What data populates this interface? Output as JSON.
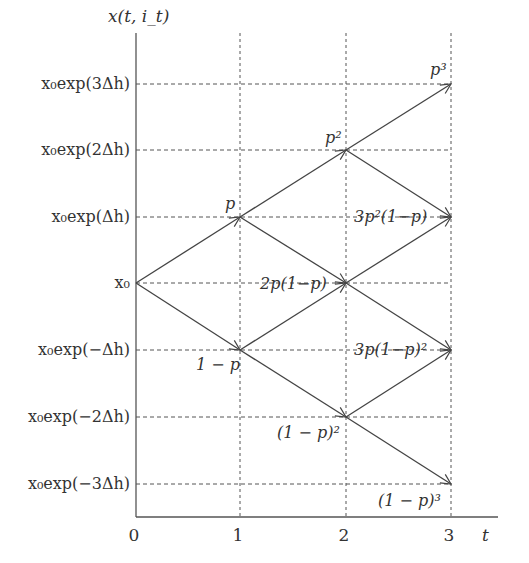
{
  "diagram": {
    "type": "binomial-tree",
    "y_axis_label": "x(t, i_t)",
    "x_axis_label": "t",
    "x_ticks": [
      "0",
      "1",
      "2",
      "3"
    ],
    "y_levels": [
      "x₀exp(3Δh)",
      "x₀exp(2Δh)",
      "x₀exp(Δh)",
      "x₀",
      "x₀exp(−Δh)",
      "x₀exp(−2Δh)",
      "x₀exp(−3Δh)"
    ],
    "node_probabilities": {
      "t1_up": "p",
      "t1_down": "1 − p",
      "t2_up2": "p²",
      "t2_mid": "2p(1−p)",
      "t2_down2": "(1 − p)²",
      "t3_up3": "p³",
      "t3_up1": "3p²(1−p)",
      "t3_down1": "3p(1−p)²",
      "t3_down3": "(1 − p)³"
    },
    "colors": {
      "line": "#444444",
      "grid": "#555555",
      "text": "#333333"
    }
  }
}
